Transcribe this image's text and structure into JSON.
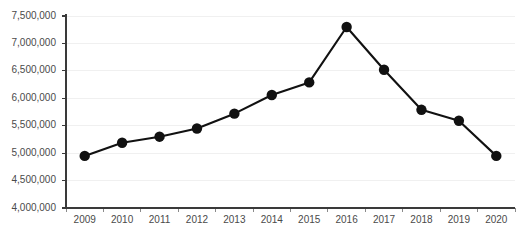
{
  "chart_data": {
    "type": "line",
    "title": "",
    "subtitle": "",
    "xlabel": "",
    "ylabel": "",
    "categories": [
      "2009",
      "2010",
      "2011",
      "2012",
      "2013",
      "2014",
      "2015",
      "2016",
      "2017",
      "2018",
      "2019",
      "2020"
    ],
    "values": [
      4950000,
      5190000,
      5300000,
      5450000,
      5720000,
      6060000,
      6290000,
      7300000,
      6520000,
      5790000,
      5590000,
      4950000
    ],
    "series": [
      {
        "name": "",
        "values": [
          4950000,
          5190000,
          5300000,
          5450000,
          5720000,
          6060000,
          6290000,
          7300000,
          6520000,
          5790000,
          5590000,
          4950000
        ]
      }
    ],
    "ylim": [
      4000000,
      7500000
    ],
    "ytick_values": [
      4000000,
      4500000,
      5000000,
      5500000,
      6000000,
      6500000,
      7000000,
      7500000
    ],
    "ytick_labels": [
      "4,000,000",
      "4,500,000",
      "5,000,000",
      "5,500,000",
      "6,000,000",
      "6,500,000",
      "7,000,000",
      "7,500,000"
    ],
    "xtick_labels": [
      "2009",
      "2010",
      "2011",
      "2012",
      "2013",
      "2014",
      "2015",
      "2016",
      "2017",
      "2018",
      "2019",
      "2020"
    ],
    "grid": true,
    "grid_axis": "y",
    "legend": false,
    "legend_position": "none",
    "marker": "circle",
    "line_color": "#111111",
    "marker_color": "#111111",
    "grid_color": "#f0f0f0",
    "axis_color": "#3a3a3a",
    "background_color": "#ffffff",
    "annotations": []
  }
}
